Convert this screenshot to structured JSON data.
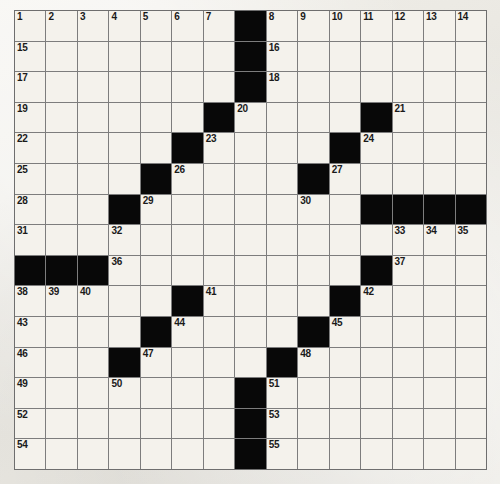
{
  "puzzle": {
    "title": "Crossword Puzzle Grid",
    "rows": 15,
    "cols": 15,
    "cell_size_px": 31.5,
    "colors": {
      "paper": "#e9e7e2",
      "cell_fill": "#f4f2ec",
      "block_fill": "#080808",
      "grid_line": "#7d7d7d",
      "number_text": "#1a1a1a"
    },
    "block_count": 35,
    "clue_number_count": 55,
    "blocks": [
      [
        1,
        8
      ],
      [
        2,
        8
      ],
      [
        3,
        8
      ],
      [
        4,
        7
      ],
      [
        4,
        12
      ],
      [
        5,
        6
      ],
      [
        5,
        11
      ],
      [
        6,
        5
      ],
      [
        6,
        10
      ],
      [
        7,
        4
      ],
      [
        7,
        12
      ],
      [
        7,
        13
      ],
      [
        7,
        14
      ],
      [
        7,
        15
      ],
      [
        9,
        1
      ],
      [
        9,
        2
      ],
      [
        9,
        3
      ],
      [
        9,
        12
      ],
      [
        10,
        6
      ],
      [
        10,
        11
      ],
      [
        11,
        5
      ],
      [
        11,
        10
      ],
      [
        12,
        4
      ],
      [
        12,
        9
      ],
      [
        13,
        8
      ],
      [
        14,
        8
      ],
      [
        15,
        8
      ]
    ],
    "numbers": [
      {
        "n": "1",
        "r": 1,
        "c": 1
      },
      {
        "n": "2",
        "r": 1,
        "c": 2
      },
      {
        "n": "3",
        "r": 1,
        "c": 3
      },
      {
        "n": "4",
        "r": 1,
        "c": 4
      },
      {
        "n": "5",
        "r": 1,
        "c": 5
      },
      {
        "n": "6",
        "r": 1,
        "c": 6
      },
      {
        "n": "7",
        "r": 1,
        "c": 7
      },
      {
        "n": "8",
        "r": 1,
        "c": 9
      },
      {
        "n": "9",
        "r": 1,
        "c": 10
      },
      {
        "n": "10",
        "r": 1,
        "c": 11
      },
      {
        "n": "11",
        "r": 1,
        "c": 12
      },
      {
        "n": "12",
        "r": 1,
        "c": 13
      },
      {
        "n": "13",
        "r": 1,
        "c": 14
      },
      {
        "n": "14",
        "r": 1,
        "c": 15
      },
      {
        "n": "15",
        "r": 2,
        "c": 1
      },
      {
        "n": "16",
        "r": 2,
        "c": 9
      },
      {
        "n": "17",
        "r": 3,
        "c": 1
      },
      {
        "n": "18",
        "r": 3,
        "c": 9
      },
      {
        "n": "19",
        "r": 4,
        "c": 1
      },
      {
        "n": "20",
        "r": 4,
        "c": 8
      },
      {
        "n": "21",
        "r": 4,
        "c": 13
      },
      {
        "n": "22",
        "r": 5,
        "c": 1
      },
      {
        "n": "23",
        "r": 5,
        "c": 7
      },
      {
        "n": "24",
        "r": 5,
        "c": 12
      },
      {
        "n": "25",
        "r": 6,
        "c": 1
      },
      {
        "n": "26",
        "r": 6,
        "c": 6
      },
      {
        "n": "27",
        "r": 6,
        "c": 11
      },
      {
        "n": "28",
        "r": 7,
        "c": 1
      },
      {
        "n": "29",
        "r": 7,
        "c": 5
      },
      {
        "n": "30",
        "r": 7,
        "c": 10
      },
      {
        "n": "31",
        "r": 8,
        "c": 1
      },
      {
        "n": "32",
        "r": 8,
        "c": 4
      },
      {
        "n": "33",
        "r": 8,
        "c": 13
      },
      {
        "n": "34",
        "r": 8,
        "c": 14
      },
      {
        "n": "35",
        "r": 8,
        "c": 15
      },
      {
        "n": "36",
        "r": 9,
        "c": 4
      },
      {
        "n": "37",
        "r": 9,
        "c": 13
      },
      {
        "n": "38",
        "r": 10,
        "c": 1
      },
      {
        "n": "39",
        "r": 10,
        "c": 2
      },
      {
        "n": "40",
        "r": 10,
        "c": 3
      },
      {
        "n": "41",
        "r": 10,
        "c": 7
      },
      {
        "n": "42",
        "r": 10,
        "c": 12
      },
      {
        "n": "43",
        "r": 11,
        "c": 1
      },
      {
        "n": "44",
        "r": 11,
        "c": 6
      },
      {
        "n": "45",
        "r": 11,
        "c": 11
      },
      {
        "n": "46",
        "r": 12,
        "c": 1
      },
      {
        "n": "47",
        "r": 12,
        "c": 5
      },
      {
        "n": "48",
        "r": 12,
        "c": 10
      },
      {
        "n": "49",
        "r": 13,
        "c": 1
      },
      {
        "n": "50",
        "r": 13,
        "c": 4
      },
      {
        "n": "51",
        "r": 13,
        "c": 9
      },
      {
        "n": "52",
        "r": 14,
        "c": 1
      },
      {
        "n": "53",
        "r": 14,
        "c": 9
      },
      {
        "n": "54",
        "r": 15,
        "c": 1
      },
      {
        "n": "55",
        "r": 15,
        "c": 9
      }
    ],
    "letters": []
  }
}
